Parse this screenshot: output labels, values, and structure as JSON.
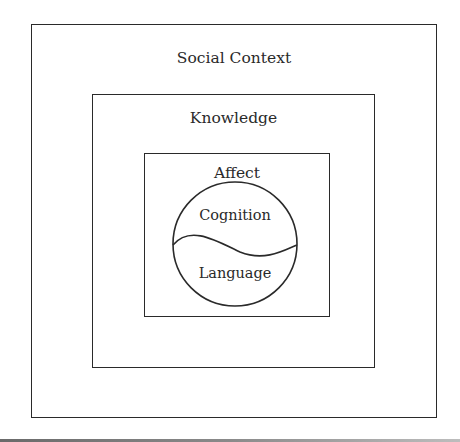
{
  "diagram": {
    "layers": [
      {
        "id": "social-context",
        "label": "Social Context"
      },
      {
        "id": "knowledge",
        "label": "Knowledge"
      },
      {
        "id": "affect",
        "label": "Affect"
      }
    ],
    "core": {
      "shape": "circle",
      "upper": "Cognition",
      "lower": "Language",
      "divider": "wavy-line"
    }
  },
  "colors": {
    "stroke": "#2a2a2a",
    "background": "#ffffff"
  }
}
